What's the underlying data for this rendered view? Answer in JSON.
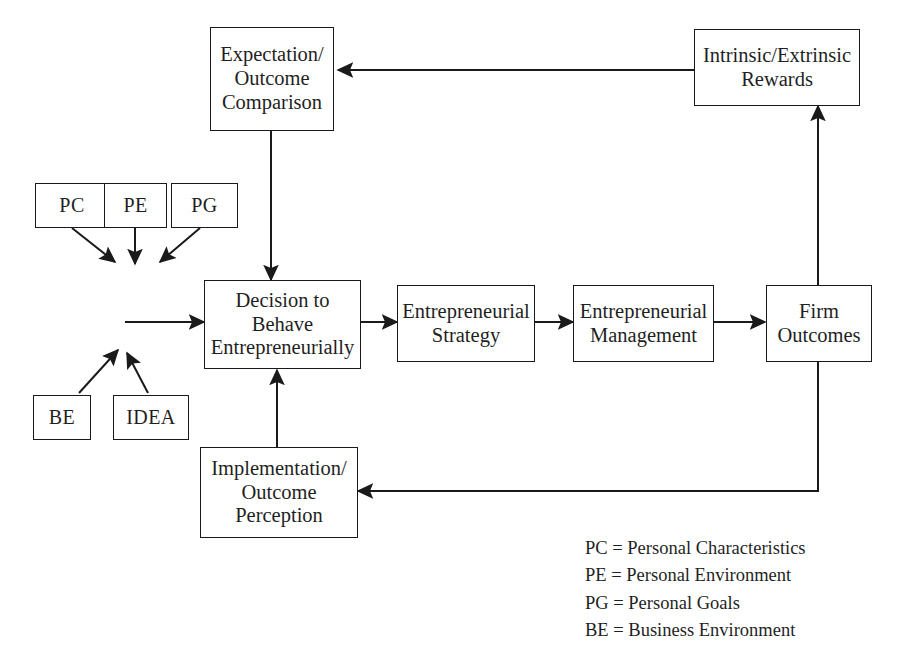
{
  "diagram": {
    "background_color": "#ffffff",
    "line_color": "#1a1a1a",
    "text_color": "#1f1f1f",
    "nodes": {
      "expectation": {
        "label": "Expectation/\nOutcome\nComparison"
      },
      "rewards": {
        "label": "Intrinsic/Extrinsic\nRewards"
      },
      "pc": {
        "label": "PC"
      },
      "pe": {
        "label": "PE"
      },
      "pg": {
        "label": "PG"
      },
      "be": {
        "label": "BE"
      },
      "idea": {
        "label": "IDEA"
      },
      "decision": {
        "label": "Decision to\nBehave\nEntrepreneurially"
      },
      "strategy": {
        "label": "Entrepreneurial\nStrategy"
      },
      "management": {
        "label": "Entrepreneurial\nManagement"
      },
      "firm_outcomes": {
        "label": "Firm\nOutcomes"
      },
      "implementation": {
        "label": "Implementation/\nOutcome\nPerception"
      }
    },
    "legend": [
      "PC = Personal Characteristics",
      "PE = Personal Environment",
      "PG = Personal Goals",
      "BE = Business Environment"
    ]
  }
}
